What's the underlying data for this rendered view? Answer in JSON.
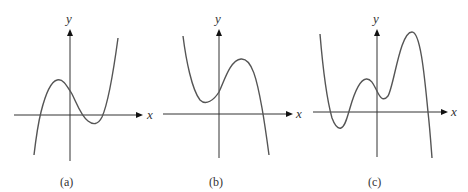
{
  "graphs": [
    {
      "caption": "(a)",
      "x_label": "x",
      "y_label": "y",
      "description": "Cubic with positive leading coefficient: rises, local max above x-axis left of y-axis, local min below x-axis right of y-axis, three real roots"
    },
    {
      "caption": "(b)",
      "x_label": "x",
      "y_label": "y",
      "description": "Cubic with negative leading coefficient: falls to local min above x-axis left of y-axis, rises to local max right of y-axis, then falls crossing x-axis once"
    },
    {
      "caption": "(c)",
      "x_label": "x",
      "y_label": "y",
      "description": "Quartic-like polynomial with negative leading coefficient: two local maxima, two local minima (one below x-axis), two real roots on left and one on right"
    }
  ]
}
